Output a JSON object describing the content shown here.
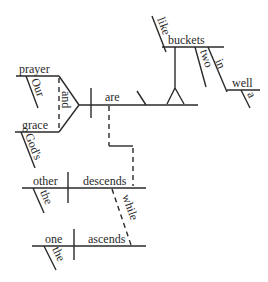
{
  "diagram": {
    "type": "sentence-diagram",
    "sentence": "Our prayer and God's grace are like two buckets in a well; while the one ascends, the other descends.",
    "main_clause": {
      "subjects": [
        "prayer",
        "grace"
      ],
      "conjunction": "and",
      "subject_modifiers": {
        "prayer": "Our",
        "grace": "God's"
      },
      "verb": "are",
      "complement": {
        "preposition": "like",
        "object": "buckets",
        "object_modifiers": [
          "two",
          "in"
        ],
        "prep_phrase": {
          "preposition": "in",
          "object": "well",
          "modifier": "a"
        }
      }
    },
    "sub_clause_1": {
      "subject": "other",
      "subject_modifier": "the",
      "verb": "descends"
    },
    "sub_clause_2": {
      "subject": "one",
      "subject_modifier": "the",
      "verb": "ascends"
    },
    "connector": "while"
  },
  "words": {
    "prayer": "prayer",
    "our": "Our",
    "and": "and",
    "grace": "grace",
    "gods": "God's",
    "are": "are",
    "like": "like",
    "buckets": "buckets",
    "two": "two",
    "in": "in",
    "well": "well",
    "a": "a",
    "other": "other",
    "the1": "the",
    "descends": "descends",
    "while": "while",
    "one": "one",
    "the2": "the",
    "ascends": "ascends"
  },
  "colors": {
    "ink": "#2a2a2a",
    "background": "#ffffff"
  }
}
